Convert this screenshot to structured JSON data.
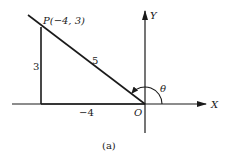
{
  "figure": {
    "caption": "(a)",
    "point_label": "P(−4, 3)",
    "hypotenuse_label": "5",
    "vertical_leg_label": "3",
    "horizontal_leg_label": "−4",
    "origin_label": "O",
    "x_axis_label": "X",
    "y_axis_label": "Y",
    "angle_label": "θ"
  },
  "geometry": {
    "point": {
      "x": -4,
      "y": 3
    },
    "hypotenuse": 5,
    "angle": "theta measured counterclockwise from positive X-axis to OP"
  },
  "colors": {
    "line": "#1a1a1a",
    "background": "#ffffff"
  }
}
